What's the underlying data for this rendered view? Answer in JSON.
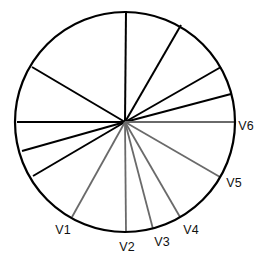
{
  "diagram": {
    "type": "radial-lead-vectors",
    "circle": {
      "cx": 125,
      "cy": 122,
      "r": 110,
      "stroke": "#000000"
    },
    "center": {
      "x": 125,
      "y": 122
    },
    "black_lines": [
      {
        "x": 126,
        "y": 11
      },
      {
        "x": 181,
        "y": 25
      },
      {
        "x": 221,
        "y": 67
      },
      {
        "x": 231,
        "y": 94
      },
      {
        "x": 17,
        "y": 122
      },
      {
        "x": 22,
        "y": 151
      },
      {
        "x": 33,
        "y": 176
      },
      {
        "x": 32,
        "y": 67
      }
    ],
    "labeled_lines": [
      {
        "label": "V1",
        "x": 72,
        "y": 217,
        "lx": 63,
        "ly": 234
      },
      {
        "label": "V2",
        "x": 126,
        "y": 232,
        "lx": 127,
        "ly": 251
      },
      {
        "label": "V3",
        "x": 153,
        "y": 229,
        "lx": 162,
        "ly": 246
      },
      {
        "label": "V4",
        "x": 180,
        "y": 217,
        "lx": 191,
        "ly": 234
      },
      {
        "label": "V5",
        "x": 220,
        "y": 177,
        "lx": 234,
        "ly": 187
      },
      {
        "label": "V6",
        "x": 234,
        "y": 122,
        "lx": 246,
        "ly": 130
      }
    ],
    "colors": {
      "black_line": "#000000",
      "gray_line": "#6a6a6a",
      "label": "#111111"
    }
  }
}
